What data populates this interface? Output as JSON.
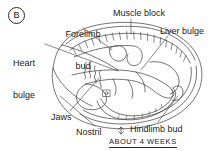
{
  "figure": {
    "panel_letter": "B",
    "caption": "ABOUT 4 WEEKS",
    "scale_marker": "double-headed-arrow",
    "ink_color": "#1a1a1a",
    "background_color": "#ffffff"
  },
  "labels": {
    "forelimb_bud_line1": "Forelimb",
    "forelimb_bud_line2": "bud",
    "muscle_block": "Muscle block",
    "liver_bulge": "Liver bulge",
    "heart_bulge_line1": "Heart",
    "heart_bulge_line2": "bulge",
    "jaws": "Jaws",
    "nostril": "Nostril",
    "hindlimb_bud": "Hindlimb bud"
  }
}
